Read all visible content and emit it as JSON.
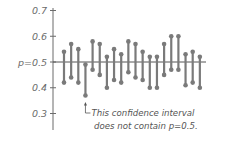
{
  "chart_data": {
    "type": "scatter",
    "subtype": "confidence-intervals",
    "title": "",
    "xlabel": "",
    "ylabel": "",
    "ylim": [
      0.3,
      0.7
    ],
    "yticks": [
      0.7,
      0.6,
      0.5,
      0.4,
      0.3
    ],
    "ytick_labels": [
      "0.7",
      "0.6",
      "p=0.5",
      "0.4",
      "0.3"
    ],
    "reference_line": {
      "value": 0.5,
      "label": "p=0.5"
    },
    "grid": false,
    "intervals": [
      {
        "lower": 0.42,
        "upper": 0.54
      },
      {
        "lower": 0.44,
        "upper": 0.57
      },
      {
        "lower": 0.42,
        "upper": 0.55
      },
      {
        "lower": 0.37,
        "upper": 0.49
      },
      {
        "lower": 0.47,
        "upper": 0.58
      },
      {
        "lower": 0.45,
        "upper": 0.57
      },
      {
        "lower": 0.4,
        "upper": 0.52
      },
      {
        "lower": 0.43,
        "upper": 0.55
      },
      {
        "lower": 0.42,
        "upper": 0.53
      },
      {
        "lower": 0.46,
        "upper": 0.58
      },
      {
        "lower": 0.44,
        "upper": 0.57
      },
      {
        "lower": 0.43,
        "upper": 0.54
      },
      {
        "lower": 0.4,
        "upper": 0.52
      },
      {
        "lower": 0.4,
        "upper": 0.52
      },
      {
        "lower": 0.45,
        "upper": 0.57
      },
      {
        "lower": 0.47,
        "upper": 0.6
      },
      {
        "lower": 0.47,
        "upper": 0.6
      },
      {
        "lower": 0.41,
        "upper": 0.53
      },
      {
        "lower": 0.42,
        "upper": 0.54
      },
      {
        "lower": 0.4,
        "upper": 0.52
      }
    ],
    "highlight_index": 3,
    "annotation": {
      "line1": "This confidence interval",
      "line2": "does not contain p=0.5."
    }
  },
  "colors": {
    "interval": "#7a7a7a",
    "axis": "#6b6b6b",
    "text": "#555555"
  }
}
